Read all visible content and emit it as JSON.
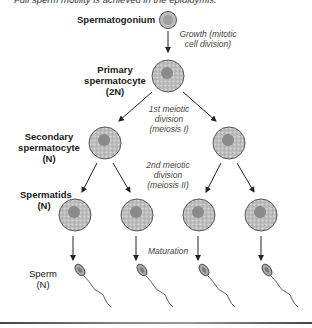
{
  "caption": "Full sperm motility is achieved in the epididymis.",
  "stages": {
    "spermatogonium": "Spermatogonium",
    "primary": [
      "Primary",
      "spermatocyte",
      "(2N)"
    ],
    "secondary": [
      "Secondary",
      "spermatocyte",
      "(N)"
    ],
    "spermatids": [
      "Spermatids",
      "(N)"
    ],
    "sperm": [
      "Sperm",
      "(N)"
    ]
  },
  "processes": {
    "growth": [
      "Growth (mitotic",
      "cell division)"
    ],
    "meiosis1": [
      "1st meiotic",
      "division",
      "(meiosis I)"
    ],
    "meiosis2": [
      "2nd meiotic",
      "division",
      "(meiosis II)"
    ],
    "maturation": "Maturation"
  },
  "colors": {
    "cell_fill": "#c8c8c8",
    "nucleus": "#8a8a8a",
    "outline": "#555555",
    "arrow": "#222222"
  }
}
